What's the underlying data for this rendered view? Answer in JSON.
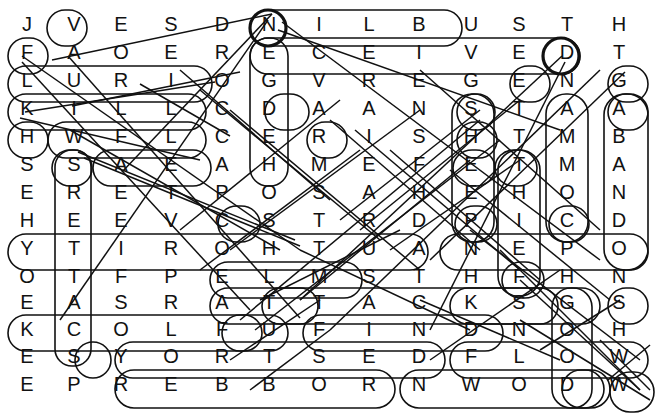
{
  "puzzle": {
    "type": "word-search",
    "title": "Word Search Grid",
    "rows": 14,
    "cols": 13,
    "ink_color": "#111111",
    "background_color": "#ffffff",
    "grid": [
      [
        "J",
        "V",
        "E",
        "S",
        "D",
        "N",
        "I",
        "L",
        "B",
        "U",
        "S",
        "T",
        "H"
      ],
      [
        "F",
        "A",
        "O",
        "E",
        "R",
        "E",
        "C",
        "E",
        "I",
        "V",
        "E",
        "D",
        "T"
      ],
      [
        "L",
        "U",
        "R",
        "I",
        "O",
        "G",
        "V",
        "R",
        "E",
        "G",
        "E",
        "N",
        "G"
      ],
      [
        "K",
        "I",
        "L",
        "L",
        "C",
        "D",
        "A",
        "A",
        "N",
        "S",
        "T",
        "A",
        "A"
      ],
      [
        "H",
        "W",
        "F",
        "L",
        "C",
        "E",
        "R",
        "I",
        "S",
        "H",
        "T",
        "M",
        "B"
      ],
      [
        "S",
        "S",
        "A",
        "E",
        "A",
        "H",
        "M",
        "E",
        "F",
        "E",
        "T",
        "M",
        "A"
      ],
      [
        "E",
        "R",
        "E",
        "T",
        "P",
        "O",
        "S",
        "A",
        "H",
        "E",
        "H",
        "O",
        "N"
      ],
      [
        "H",
        "E",
        "E",
        "V",
        "C",
        "S",
        "T",
        "R",
        "D",
        "P",
        "I",
        "C",
        "D"
      ],
      [
        "Y",
        "T",
        "I",
        "R",
        "O",
        "H",
        "T",
        "U",
        "A",
        "N",
        "E",
        "P",
        "O"
      ],
      [
        "O",
        "T",
        "F",
        "P",
        "E",
        "L",
        "M",
        "S",
        "T",
        "H",
        "F",
        "H",
        "N"
      ],
      [
        "E",
        "A",
        "S",
        "R",
        "A",
        "T",
        "T",
        "A",
        "C",
        "K",
        "S",
        "G",
        "S"
      ],
      [
        "K",
        "C",
        "O",
        "L",
        "F",
        "U",
        "F",
        "I",
        "N",
        "D",
        "N",
        "O",
        "H"
      ],
      [
        "E",
        "S",
        "Y",
        "O",
        "R",
        "T",
        "S",
        "E",
        "D",
        "F",
        "L",
        "O",
        "W"
      ],
      [
        "E",
        "P",
        "R",
        "E",
        "B",
        "B",
        "O",
        "R",
        "N",
        "W",
        "O",
        "D",
        "W"
      ]
    ],
    "found_words": [
      {
        "word": "SUBLIND",
        "text": "D N I L B",
        "row": 1,
        "start_col": 5,
        "end_col": 9,
        "direction": "horizontal"
      },
      {
        "word": "RECEIVED",
        "text": "R E C E I V E D",
        "row": 2,
        "start_col": 5,
        "end_col": 12,
        "direction": "horizontal"
      },
      {
        "word": "KILL",
        "text": "K I L L",
        "row": 4,
        "start_col": 1,
        "end_col": 4,
        "direction": "horizontal"
      },
      {
        "word": "AUTHORITY",
        "text": "Y T I R O H T U A",
        "row": 9,
        "start_col": 1,
        "end_col": 9,
        "direction": "horizontal-reverse"
      },
      {
        "word": "OPEN",
        "text": "N E P O",
        "row": 9,
        "start_col": 10,
        "end_col": 13,
        "direction": "horizontal-reverse"
      },
      {
        "word": "ATTACKS",
        "text": "A T T A C K S",
        "row": 11,
        "start_col": 5,
        "end_col": 11,
        "direction": "horizontal"
      },
      {
        "word": "FIND",
        "text": "F I N D",
        "row": 12,
        "start_col": 7,
        "end_col": 10,
        "direction": "horizontal"
      },
      {
        "word": "KCOLFU",
        "text": "K C O L F U",
        "row": 12,
        "start_col": 1,
        "end_col": 6,
        "direction": "horizontal-reverse"
      },
      {
        "word": "DESTROY",
        "text": "Y O R T S E D",
        "row": 13,
        "start_col": 3,
        "end_col": 9,
        "direction": "horizontal-reverse"
      },
      {
        "word": "FLOW",
        "text": "F L O W",
        "row": 13,
        "start_col": 10,
        "end_col": 13,
        "direction": "horizontal"
      },
      {
        "word": "ROBBER",
        "text": "R E B B O R",
        "row": 14,
        "start_col": 3,
        "end_col": 8,
        "direction": "horizontal-reverse"
      },
      {
        "word": "NWOD",
        "text": "N W O D",
        "row": 14,
        "start_col": 9,
        "end_col": 12,
        "direction": "horizontal-reverse"
      },
      {
        "word": "COMMAND",
        "text": "C O M M A",
        "col": 12,
        "start_row": 4,
        "end_row": 8,
        "direction": "vertical-reverse"
      },
      {
        "word": "ABANDON",
        "text": "A B A N D O",
        "col": 13,
        "start_row": 4,
        "end_row": 9,
        "direction": "vertical"
      },
      {
        "word": "THIEF",
        "text": "T H I E F",
        "col": 11,
        "start_row": 6,
        "end_row": 10,
        "direction": "vertical"
      },
      {
        "word": "SHEEP",
        "text": "S H E E P",
        "col": 10,
        "start_row": 4,
        "end_row": 8,
        "direction": "vertical"
      },
      {
        "word": "STREETS",
        "text": "S R E E T T A C S",
        "col": 2,
        "start_row": 6,
        "end_row": 13,
        "direction": "vertical"
      },
      {
        "word": "CROC",
        "text": "C C A",
        "col": 5,
        "start_row": 2,
        "end_row": 6,
        "direction": "vertical"
      },
      {
        "word": "GOOD",
        "text": "G O O D",
        "col": 12,
        "start_row": 11,
        "end_row": 14,
        "direction": "vertical"
      },
      {
        "word": "DIAGONAL-1",
        "text": "diagonal",
        "direction": "diagonal"
      }
    ],
    "letter_list_flat": "JVESDNILBUSTH FAOERECEIVEDT LURIOGVREGENG KILLCDAANSTAA HWFLCERISHTMB SSAEAHMEFETMA ERETPOSAHEHON HEEVCSTRDPICD YTIROHTUANEPO OTFPELMSTHFHN EASRATTACKSGS KCOLFUFINDNOH ESYORTSEDFLOW EPREBBORNWODW"
  }
}
